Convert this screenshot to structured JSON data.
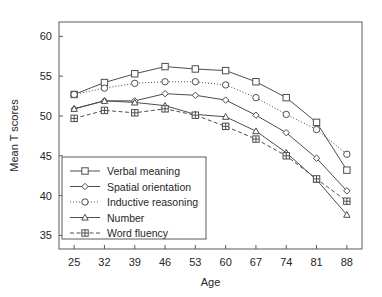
{
  "chart_data": {
    "type": "line",
    "title": "",
    "xlabel": "Age",
    "ylabel": "Mean T scores",
    "x": [
      25,
      32,
      39,
      46,
      53,
      60,
      67,
      74,
      81,
      88
    ],
    "xticklabels": [
      "25",
      "32",
      "39",
      "46",
      "53",
      "60",
      "67",
      "74",
      "81",
      "88"
    ],
    "yticks": [
      35,
      40,
      45,
      50,
      55,
      60
    ],
    "yticklabels": [
      "35",
      "40",
      "45",
      "50",
      "55",
      "60"
    ],
    "xlim": [
      21.5,
      91.5
    ],
    "ylim": [
      33.3,
      61.8
    ],
    "grid": false,
    "legend_position": "lower left",
    "series": [
      {
        "name": "Verbal meaning",
        "marker": "square",
        "linestyle": "solid",
        "values": [
          52.7,
          54.2,
          55.3,
          56.2,
          55.9,
          55.7,
          54.3,
          52.3,
          49.2,
          43.2
        ]
      },
      {
        "name": "Spatial orientation",
        "marker": "diamond",
        "linestyle": "solid",
        "values": [
          50.9,
          51.9,
          51.9,
          52.8,
          52.6,
          52.0,
          50.1,
          47.9,
          44.7,
          40.6
        ]
      },
      {
        "name": "Inductive reasoning",
        "marker": "circle",
        "linestyle": "dotted",
        "values": [
          52.7,
          53.5,
          54.1,
          54.3,
          54.3,
          53.9,
          52.3,
          50.2,
          48.3,
          45.2
        ]
      },
      {
        "name": "Number",
        "marker": "triangle",
        "linestyle": "solid",
        "values": [
          50.9,
          51.9,
          51.7,
          51.3,
          50.2,
          49.9,
          48.1,
          45.4,
          42.0,
          37.6
        ]
      },
      {
        "name": "Word fluency",
        "marker": "square-plus",
        "linestyle": "dashed",
        "values": [
          49.7,
          50.7,
          50.4,
          50.9,
          50.1,
          48.7,
          47.1,
          45.0,
          42.1,
          39.3
        ]
      }
    ]
  },
  "legend": {
    "items": [
      {
        "label": "Verbal meaning"
      },
      {
        "label": "Spatial orientation"
      },
      {
        "label": "Inductive reasoning"
      },
      {
        "label": "Number"
      },
      {
        "label": "Word fluency"
      }
    ]
  },
  "colors": {
    "line": "#4d4d4d",
    "axis": "#5a5a5a",
    "text": "#262626",
    "background": "#ffffff"
  }
}
